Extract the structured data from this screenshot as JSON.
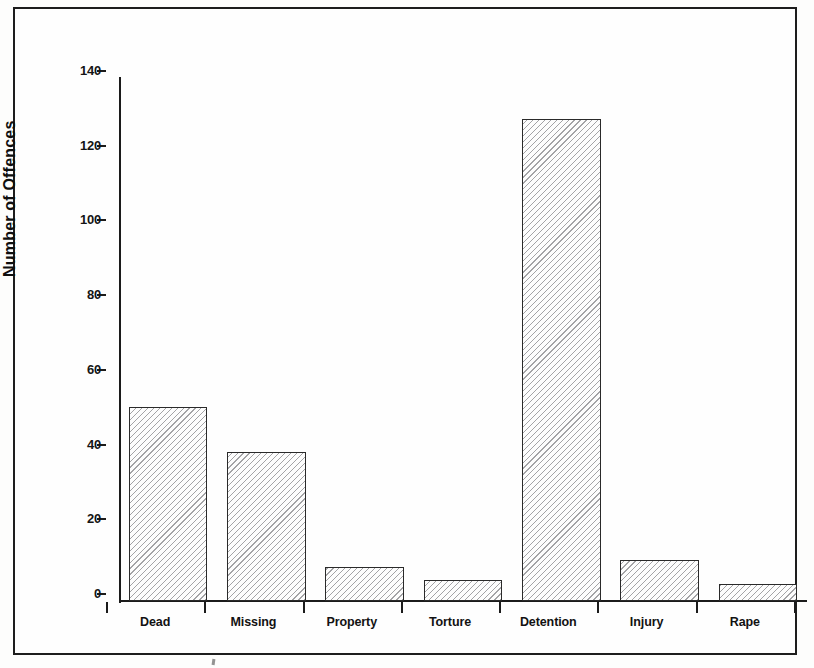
{
  "figure": {
    "y_axis_title": "Number of Offences",
    "y_ticks": [
      "0",
      "20",
      "40",
      "60",
      "80",
      "100",
      "120",
      "140"
    ],
    "x_labels": [
      "Dead",
      "Missing",
      "Property",
      "Torture",
      "Detention",
      "Injury",
      "Rape"
    ]
  },
  "chart_data": {
    "type": "bar",
    "title": "",
    "subtitle": "",
    "xlabel": "",
    "ylabel": "Number of Offences",
    "categories": [
      "Dead",
      "Missing",
      "Property",
      "Torture",
      "Detention",
      "Injury",
      "Rape"
    ],
    "values": [
      52,
      40,
      9,
      5.5,
      129,
      11,
      4.5
    ],
    "ylim": [
      0,
      140
    ],
    "y_tick_values": [
      0,
      20,
      40,
      60,
      80,
      100,
      120,
      140
    ],
    "grid": false,
    "legend": false,
    "bar_fill": "#fdfdfd",
    "bar_hatch": "diagonal-hatch",
    "bar_edge_color": "#2a2a2a",
    "axis_color": "#1b1b1b"
  }
}
